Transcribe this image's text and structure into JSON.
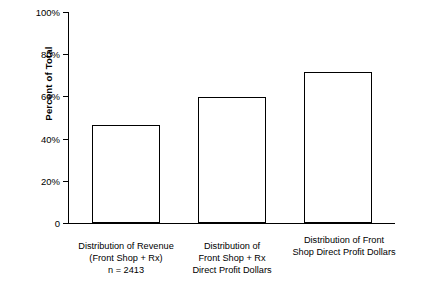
{
  "chart_data": {
    "type": "bar",
    "title": "",
    "xlabel": "",
    "ylabel": "Percent of Total",
    "ylim": [
      0,
      100
    ],
    "yticks": [
      "0",
      "20%",
      "40%",
      "60%",
      "80%",
      "100%"
    ],
    "ytick_values": [
      0,
      20,
      40,
      60,
      80,
      100
    ],
    "grid": false,
    "legend": null,
    "categories": [
      "Distribution of Revenue\n(Front Shop + Rx)\nn = 2413",
      "Distribution of\nFront Shop + Rx\nDirect Profit Dollars",
      "Distribution of Front\nShop Direct Profit Dollars"
    ],
    "values": [
      46.5,
      59.5,
      71.5
    ]
  },
  "axis": {
    "y_title": "Percent of Total",
    "ticks": [
      {
        "label": "100%",
        "value": 100
      },
      {
        "label": "80%",
        "value": 80
      },
      {
        "label": "60%",
        "value": 60
      },
      {
        "label": "40%",
        "value": 40
      },
      {
        "label": "20%",
        "value": 20
      },
      {
        "label": "0",
        "value": 0
      }
    ]
  },
  "bars": [
    {
      "value": 46.5,
      "label_line1": "Distribution of Revenue",
      "label_line2": "(Front Shop + Rx)",
      "label_line3": "n = 2413"
    },
    {
      "value": 59.5,
      "label_line1": "Distribution of",
      "label_line2": "Front Shop + Rx",
      "label_line3": "Direct Profit Dollars"
    },
    {
      "value": 71.5,
      "label_line1": "Distribution of Front",
      "label_line2": "Shop Direct Profit Dollars",
      "label_line3": ""
    }
  ],
  "footer": {
    "corner_mark": ""
  }
}
